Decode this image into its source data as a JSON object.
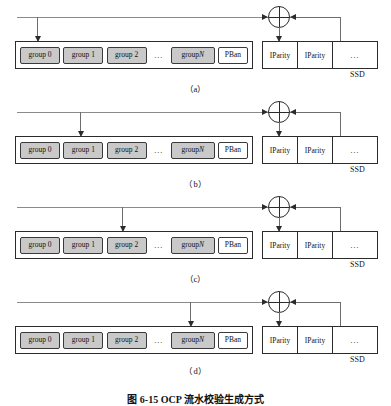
{
  "figure": {
    "caption": "图 6-15  OCP 流水校验生成方式",
    "ssd_label": "SSD",
    "group_labels": {
      "g0": "group 0",
      "g1": "group 1",
      "g2": "group 2",
      "ellipsis": "...",
      "gn_prefix": "group ",
      "gn_index": "N",
      "pban": "PBan"
    },
    "ssd_cells": {
      "iparity_a": "IParity",
      "iparity_b": "IParity",
      "rest": "..."
    },
    "xor_symbol": "xor-node",
    "panels": [
      {
        "caption": "（a）",
        "target": "group 0",
        "drop_x": 37
      },
      {
        "caption": "（b）",
        "target": "group 1",
        "drop_x": 80
      },
      {
        "caption": "（c）",
        "target": "group 2",
        "drop_x": 122
      },
      {
        "caption": "（d）",
        "target": "group N",
        "drop_x": 190
      }
    ],
    "colors": {
      "group_fill": "#c9c9c9",
      "box_stroke": "#2b2b2b",
      "line": "#6d6d6d",
      "background": "#ffffff"
    }
  }
}
